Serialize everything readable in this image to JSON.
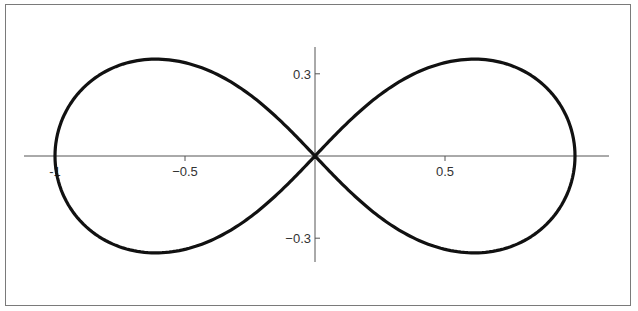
{
  "chart_data": {
    "type": "line",
    "title": "",
    "xlabel": "",
    "ylabel": "",
    "xlim": [
      -1.12,
      1.13
    ],
    "ylim": [
      -0.38,
      0.4
    ],
    "grid": false,
    "legend": null,
    "x_ticks": [
      {
        "value": -1,
        "label": "-1"
      },
      {
        "value": -0.5,
        "label": "−0.5"
      },
      {
        "value": 0.5,
        "label": "0.5"
      }
    ],
    "y_ticks": [
      {
        "value": 0.3,
        "label": "0.3"
      },
      {
        "value": -0.3,
        "label": "−0.3"
      }
    ],
    "series": [
      {
        "name": "lemniscate",
        "color": "#111111",
        "parametric": "r^2 = cos(2t)",
        "points": [
          [
            1.0,
            0.0
          ],
          [
            0.98,
            0.13
          ],
          [
            0.93,
            0.22
          ],
          [
            0.85,
            0.29
          ],
          [
            0.75,
            0.33
          ],
          [
            0.612,
            0.354
          ],
          [
            0.5,
            0.35
          ],
          [
            0.4,
            0.32
          ],
          [
            0.3,
            0.26
          ],
          [
            0.2,
            0.18
          ],
          [
            0.1,
            0.095
          ],
          [
            0.0,
            0.0
          ],
          [
            -0.1,
            -0.095
          ],
          [
            -0.2,
            -0.18
          ],
          [
            -0.3,
            -0.26
          ],
          [
            -0.4,
            -0.32
          ],
          [
            -0.5,
            -0.35
          ],
          [
            -0.612,
            -0.354
          ],
          [
            -0.75,
            -0.33
          ],
          [
            -0.85,
            -0.29
          ],
          [
            -0.93,
            -0.22
          ],
          [
            -0.98,
            -0.13
          ],
          [
            -1.0,
            0.0
          ],
          [
            -0.98,
            0.13
          ],
          [
            -0.93,
            0.22
          ],
          [
            -0.85,
            0.29
          ],
          [
            -0.75,
            0.33
          ],
          [
            -0.612,
            0.354
          ],
          [
            -0.5,
            0.35
          ],
          [
            -0.4,
            0.32
          ],
          [
            -0.3,
            0.26
          ],
          [
            -0.2,
            0.18
          ],
          [
            -0.1,
            0.095
          ],
          [
            0.0,
            0.0
          ],
          [
            0.1,
            -0.095
          ],
          [
            0.2,
            -0.18
          ],
          [
            0.3,
            -0.26
          ],
          [
            0.4,
            -0.32
          ],
          [
            0.5,
            -0.35
          ],
          [
            0.612,
            -0.354
          ],
          [
            0.75,
            -0.33
          ],
          [
            0.85,
            -0.29
          ],
          [
            0.93,
            -0.22
          ],
          [
            0.98,
            -0.13
          ],
          [
            1.0,
            0.0
          ]
        ]
      }
    ]
  },
  "layout": {
    "origin_px": [
      315,
      156
    ],
    "x_scale_px_per_unit": 260,
    "y_scale_px_per_unit": 274,
    "x_axis_px": [
      24,
      609
    ],
    "y_axis_px": [
      47,
      262
    ],
    "curve_color": "#111111",
    "axis_color": "#555555",
    "frame_color": "#7a7a7a"
  }
}
